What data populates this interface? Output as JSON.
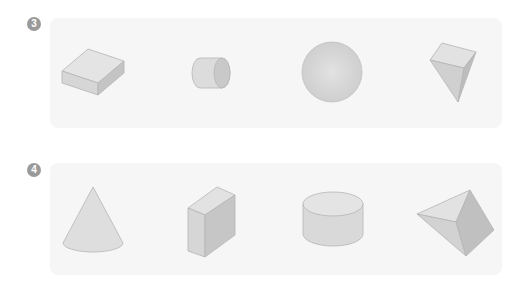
{
  "problems": [
    {
      "number": "3",
      "shapes": [
        {
          "name": "rectangular-prism-flat",
          "label": "flat rectangular prism"
        },
        {
          "name": "cylinder-side",
          "label": "cylinder (lying)"
        },
        {
          "name": "sphere",
          "label": "sphere"
        },
        {
          "name": "square-pyramid-inverted",
          "label": "square pyramid"
        }
      ]
    },
    {
      "number": "4",
      "shapes": [
        {
          "name": "cone",
          "label": "cone"
        },
        {
          "name": "rectangular-prism-upright",
          "label": "rectangular prism"
        },
        {
          "name": "cylinder-upright",
          "label": "cylinder"
        },
        {
          "name": "triangular-pyramid",
          "label": "pyramid"
        }
      ]
    }
  ],
  "colors": {
    "badge": "#9a9a9a",
    "panel": "#f6f6f6",
    "shape_light": "#e2e2e2",
    "shape_mid": "#d2d2d2",
    "shape_dark": "#bcbcbc",
    "edge": "#b0b0b0"
  }
}
